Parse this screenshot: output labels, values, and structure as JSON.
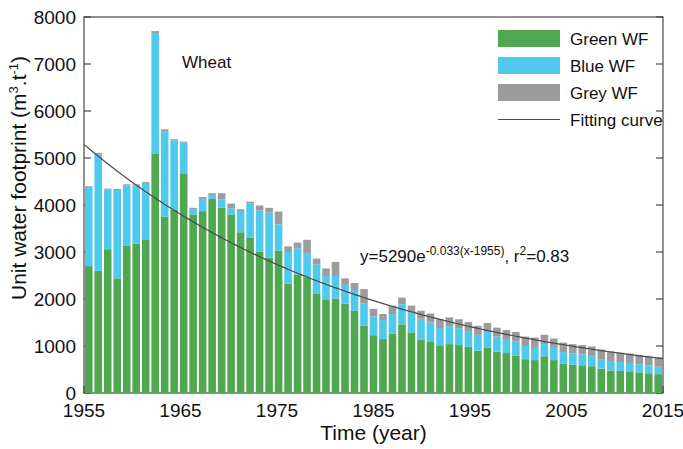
{
  "chart_data": {
    "type": "bar",
    "subtype": "stacked-bar-with-fitted-line",
    "title": "",
    "annotation_label": "Wheat",
    "xlabel": "Time (year)",
    "ylabel": "Unit water footprint (m3.t-1)",
    "ylabel_parts": {
      "text": "Unit water footprint (m",
      "sup1": "3",
      "mid": ".t",
      "sup2": "-1",
      "tail": ")"
    },
    "xlim": [
      1955,
      2015
    ],
    "ylim": [
      0,
      8000
    ],
    "ytick_labels": [
      "0",
      "1000",
      "2000",
      "3000",
      "4000",
      "5000",
      "6000",
      "7000",
      "8000"
    ],
    "yticks": [
      0,
      1000,
      2000,
      3000,
      4000,
      5000,
      6000,
      7000,
      8000
    ],
    "xtick_labels": [
      "1955",
      "1965",
      "1975",
      "1985",
      "1995",
      "2005",
      "2015"
    ],
    "xticks": [
      1955,
      1965,
      1975,
      1985,
      1995,
      2005,
      2015
    ],
    "grid": false,
    "legend_position": "top-right",
    "legend": [
      {
        "label": "Green WF",
        "color": "#4FA74F",
        "marker": "swatch"
      },
      {
        "label": "Blue WF",
        "color": "#4FC9EE",
        "marker": "swatch"
      },
      {
        "label": "Grey WF",
        "color": "#9C9C9C",
        "marker": "swatch"
      },
      {
        "label": "Fitting curve",
        "color": "#4A4A4A",
        "marker": "line"
      }
    ],
    "equation": {
      "lhs": "y=5290e",
      "exp": "-0.033(x-1955)",
      "comma": ", r",
      "r_sup": "2",
      "r_val": "=0.83",
      "plain": "y=5290e^-0.033(x-1955), r2=0.83",
      "amplitude": 5290,
      "rate": -0.033,
      "x0": 1955,
      "r_squared": 0.83
    },
    "categories": [
      1955,
      1956,
      1957,
      1958,
      1959,
      1960,
      1961,
      1962,
      1963,
      1964,
      1965,
      1966,
      1967,
      1968,
      1969,
      1970,
      1971,
      1972,
      1973,
      1974,
      1975,
      1976,
      1977,
      1978,
      1979,
      1980,
      1981,
      1982,
      1983,
      1984,
      1985,
      1986,
      1987,
      1988,
      1989,
      1990,
      1991,
      1992,
      1993,
      1994,
      1995,
      1996,
      1997,
      1998,
      1999,
      2000,
      2001,
      2002,
      2003,
      2004,
      2005,
      2006,
      2007,
      2008,
      2009,
      2010,
      2011,
      2012,
      2013,
      2014,
      2015
    ],
    "series": [
      {
        "name": "Green WF",
        "color": "#4FA74F",
        "values": [
          2700,
          2600,
          3060,
          2440,
          3140,
          3180,
          3270,
          5100,
          3750,
          3900,
          4660,
          3800,
          3870,
          4130,
          3940,
          3800,
          3420,
          3300,
          3010,
          2880,
          3030,
          2330,
          2520,
          2460,
          2120,
          1980,
          2010,
          1900,
          1750,
          1430,
          1230,
          1150,
          1260,
          1460,
          1290,
          1140,
          1100,
          1000,
          1040,
          1020,
          980,
          900,
          960,
          880,
          850,
          800,
          720,
          700,
          780,
          700,
          620,
          600,
          590,
          570,
          520,
          480,
          470,
          460,
          440,
          420,
          400
        ]
      },
      {
        "name": "Blue WF",
        "color": "#4FC9EE",
        "values": [
          1680,
          2480,
          1270,
          1880,
          1280,
          1240,
          1200,
          2560,
          1820,
          1480,
          670,
          100,
          260,
          80,
          180,
          130,
          450,
          730,
          870,
          960,
          560,
          670,
          560,
          520,
          620,
          510,
          480,
          400,
          440,
          480,
          400,
          400,
          420,
          430,
          420,
          440,
          400,
          380,
          380,
          360,
          340,
          340,
          340,
          320,
          300,
          300,
          280,
          280,
          260,
          260,
          250,
          240,
          230,
          220,
          200,
          200,
          190,
          180,
          170,
          170,
          160
        ]
      },
      {
        "name": "Grey WF",
        "color": "#9C9C9C",
        "values": [
          20,
          30,
          20,
          20,
          20,
          20,
          20,
          40,
          40,
          20,
          20,
          40,
          40,
          40,
          130,
          100,
          40,
          40,
          110,
          100,
          270,
          120,
          120,
          280,
          120,
          160,
          300,
          140,
          150,
          300,
          160,
          130,
          180,
          140,
          150,
          170,
          190,
          190,
          190,
          190,
          190,
          190,
          190,
          190,
          190,
          200,
          200,
          200,
          200,
          200,
          200,
          200,
          200,
          200,
          200,
          200,
          200,
          200,
          200,
          200,
          200
        ]
      }
    ],
    "totals": [
      4400,
      5110,
      4350,
      4340,
      4440,
      4440,
      4490,
      7700,
      5610,
      5400,
      5350,
      3940,
      4170,
      4250,
      4250,
      4030,
      3910,
      4070,
      3990,
      3940,
      3860,
      3120,
      3200,
      3260,
      2860,
      2650,
      2790,
      2440,
      2340,
      2210,
      1790,
      1680,
      1860,
      2030,
      1860,
      1750,
      1690,
      1570,
      1610,
      1570,
      1510,
      1430,
      1490,
      1390,
      1340,
      1300,
      1200,
      1180,
      1240,
      1160,
      1070,
      1040,
      1020,
      990,
      920,
      880,
      860,
      840,
      810,
      790,
      760
    ]
  },
  "colors": {
    "green": "#4FA74F",
    "blue": "#4FC9EE",
    "grey": "#9C9C9C",
    "curve": "#4A4A4A",
    "axis": "#3A3A3A",
    "background": "#FFFFFF"
  }
}
